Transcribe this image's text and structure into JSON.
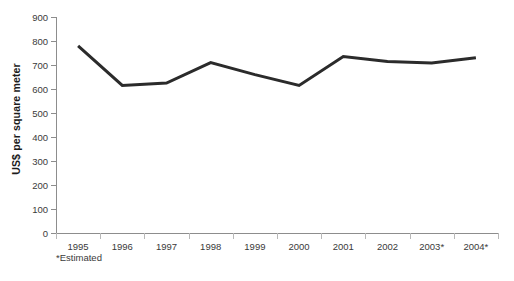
{
  "chart_data": {
    "type": "line",
    "title": "",
    "subtitle": "",
    "xlabel": "",
    "ylabel": "US$ per square meter",
    "categories": [
      "1995",
      "1996",
      "1997",
      "1998",
      "1999",
      "2000",
      "2001",
      "2002",
      "2003*",
      "2004*"
    ],
    "values": [
      780,
      615,
      625,
      710,
      660,
      615,
      735,
      715,
      708,
      730
    ],
    "series": [
      {
        "name": "US$ per square meter",
        "values": [
          780,
          615,
          625,
          710,
          660,
          615,
          735,
          715,
          708,
          730
        ]
      }
    ],
    "ylim": [
      0,
      900
    ],
    "ytick_labels": [
      "900",
      "800",
      "700",
      "600",
      "500",
      "400",
      "300",
      "200",
      "100",
      "0"
    ],
    "ytick_values": [
      900,
      800,
      700,
      600,
      500,
      400,
      300,
      200,
      100,
      0
    ],
    "ytick_step": 100,
    "grid": false,
    "legend": "none",
    "annotations": [
      "*Estimated"
    ],
    "footnote": "*Estimated",
    "line_color": "#2b2b2b",
    "axis_color": "#8d8d8d",
    "tick_color": "#b8b8b8",
    "text_color": "#3a3a3a",
    "background_color": "#ffffff"
  }
}
